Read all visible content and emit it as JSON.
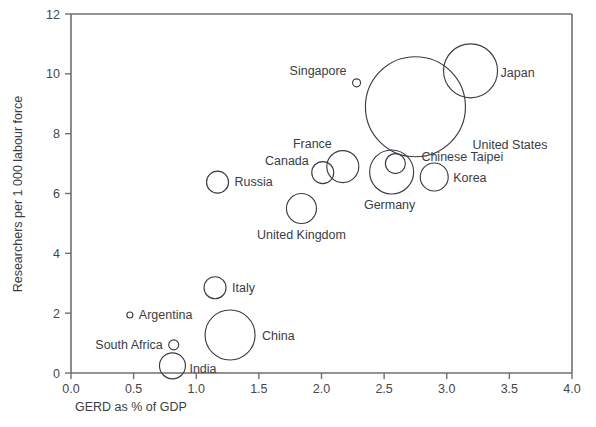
{
  "chart_data": {
    "type": "scatter",
    "title": "",
    "subtitle": "",
    "xlabel": "GERD as % of GDP",
    "ylabel": "Researchers per 1 000 labour force",
    "xlim": [
      0.0,
      4.0
    ],
    "ylim": [
      0,
      12
    ],
    "xticks": [
      "0.0",
      "0.5",
      "1.0",
      "1.5",
      "2.0",
      "2.5",
      "3.0",
      "3.5",
      "4.0"
    ],
    "xtick_values": [
      0.0,
      0.5,
      1.0,
      1.5,
      2.0,
      2.5,
      3.0,
      3.5,
      4.0
    ],
    "yticks": [
      "0",
      "2",
      "4",
      "6",
      "8",
      "10",
      "12"
    ],
    "ytick_values": [
      0,
      2,
      4,
      6,
      8,
      10,
      12
    ],
    "grid": false,
    "legend": "none",
    "bubble_encoding": "circle area proportional to number of researchers",
    "points": [
      {
        "name": "Japan",
        "x": 3.19,
        "y": 10.1,
        "r_px": 27,
        "label_dx": 30,
        "label_dy": 6,
        "anchor": "start"
      },
      {
        "name": "United States",
        "x": 2.75,
        "y": 8.9,
        "r_px": 50,
        "label_dx": 57,
        "label_dy": 42,
        "anchor": "start"
      },
      {
        "name": "Singapore",
        "x": 2.28,
        "y": 9.7,
        "r_px": 4,
        "label_dx": -10,
        "label_dy": -8,
        "anchor": "end"
      },
      {
        "name": "France",
        "x": 2.17,
        "y": 6.9,
        "r_px": 16,
        "label_dx": -11,
        "label_dy": -19,
        "anchor": "end"
      },
      {
        "name": "Canada",
        "x": 2.01,
        "y": 6.7,
        "r_px": 11,
        "label_dx": -14,
        "label_dy": -8,
        "anchor": "end"
      },
      {
        "name": "Chinese Taipei",
        "x": 2.59,
        "y": 7.0,
        "r_px": 10,
        "label_dx": 26,
        "label_dy": -3,
        "anchor": "start"
      },
      {
        "name": "Germany",
        "x": 2.56,
        "y": 6.72,
        "r_px": 22,
        "label_dx": -2,
        "label_dy": 37,
        "anchor": "middle"
      },
      {
        "name": "Korea",
        "x": 2.9,
        "y": 6.55,
        "r_px": 14,
        "label_dx": 19,
        "label_dy": 5,
        "anchor": "start"
      },
      {
        "name": "Russia",
        "x": 1.17,
        "y": 6.38,
        "r_px": 11,
        "label_dx": 17,
        "label_dy": 4,
        "anchor": "start"
      },
      {
        "name": "United Kingdom",
        "x": 1.84,
        "y": 5.5,
        "r_px": 15,
        "label_dx": 0,
        "label_dy": 31,
        "anchor": "middle"
      },
      {
        "name": "Italy",
        "x": 1.15,
        "y": 2.85,
        "r_px": 11,
        "label_dx": 17,
        "label_dy": 4,
        "anchor": "start"
      },
      {
        "name": "China",
        "x": 1.27,
        "y": 1.27,
        "r_px": 25,
        "label_dx": 32,
        "label_dy": 5,
        "anchor": "start"
      },
      {
        "name": "Argentina",
        "x": 0.47,
        "y": 1.94,
        "r_px": 3,
        "label_dx": 9,
        "label_dy": 4,
        "anchor": "start"
      },
      {
        "name": "South Africa",
        "x": 0.82,
        "y": 0.94,
        "r_px": 5,
        "label_dx": -11,
        "label_dy": 4,
        "anchor": "end"
      },
      {
        "name": "India",
        "x": 0.81,
        "y": 0.24,
        "r_px": 13,
        "label_dx": 17,
        "label_dy": 7,
        "anchor": "start"
      }
    ]
  },
  "axes": {
    "x_title": "GERD as % of GDP",
    "y_title": "Researchers per 1 000 labour force"
  },
  "colors": {
    "bubble_stroke": "#3c3c44",
    "axis": "#6f6f6f",
    "text": "#3c3c44",
    "background": "#ffffff"
  }
}
